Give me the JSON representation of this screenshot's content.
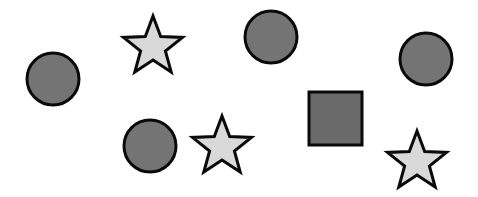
{
  "canvas": {
    "width": 478,
    "height": 197,
    "background": "#ffffff"
  },
  "colors": {
    "circle_fill": "#747474",
    "square_fill": "#6a6a6a",
    "star_fill": "#d9d9d9",
    "stroke": "#0a0a0a"
  },
  "shapes": [
    {
      "type": "circle",
      "name": "circle-1",
      "cx": 53,
      "cy": 79,
      "r": 26
    },
    {
      "type": "star",
      "name": "star-1",
      "cx": 153,
      "cy": 47,
      "r": 31
    },
    {
      "type": "circle",
      "name": "circle-2",
      "cx": 271,
      "cy": 37,
      "r": 26
    },
    {
      "type": "circle",
      "name": "circle-3",
      "cx": 426,
      "cy": 59,
      "r": 26
    },
    {
      "type": "square",
      "name": "square-1",
      "x": 309,
      "y": 92,
      "size": 53
    },
    {
      "type": "circle",
      "name": "circle-4",
      "cx": 150,
      "cy": 146,
      "r": 26
    },
    {
      "type": "star",
      "name": "star-2",
      "cx": 222,
      "cy": 147,
      "r": 31
    },
    {
      "type": "star",
      "name": "star-3",
      "cx": 417,
      "cy": 162,
      "r": 31
    }
  ]
}
